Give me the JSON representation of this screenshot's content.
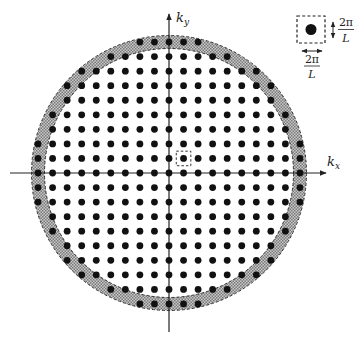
{
  "figure": {
    "type": "reciprocal-space lattice diagram",
    "origin": {
      "x": 169,
      "y": 173
    },
    "lattice": {
      "spacing_px": 14.55,
      "dot_radius_px": 3.4,
      "max_index": 10,
      "fill_radius_px": 137,
      "color": "#111111"
    },
    "shell": {
      "inner_radius_px": 124.5,
      "outer_radius_px": 137.5,
      "fill_pattern": "checker-gray",
      "edge_style": "dashed",
      "colors": {
        "light": "#c8c8c8",
        "dark": "#7a7a7a",
        "edge": "#333333"
      }
    },
    "highlight_cell": {
      "lattice_index": {
        "i": 1,
        "j": 1
      },
      "style": "dashed-square"
    },
    "axes": {
      "x": {
        "label_main": "k",
        "label_sub": "x",
        "from": 10,
        "to": 326
      },
      "y": {
        "label_main": "k",
        "label_sub": "y",
        "from": 332,
        "to": 14
      }
    },
    "legend": {
      "description": "unit cell in k-space",
      "width_label": {
        "numerator": "2π",
        "denominator": "L"
      },
      "height_label": {
        "numerator": "2π",
        "denominator": "L"
      }
    }
  }
}
